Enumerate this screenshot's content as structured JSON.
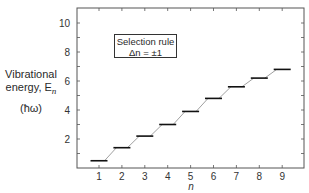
{
  "chart_data": {
    "type": "line",
    "title": "",
    "xlabel": "n",
    "ylabel": "Vibrational energy, E_n (ħω)",
    "ylabel_lines": [
      "Vibrational",
      "energy, E",
      "(ħω)"
    ],
    "ylabel_subscript": "n",
    "x": [
      1,
      2,
      3,
      4,
      5,
      6,
      7,
      8,
      9
    ],
    "values": [
      0.5,
      1.4,
      2.2,
      3.0,
      3.9,
      4.8,
      5.6,
      6.2,
      6.8
    ],
    "series": [
      {
        "name": "Energy levels",
        "values": [
          0.5,
          1.4,
          2.2,
          3.0,
          3.9,
          4.8,
          5.6,
          6.2,
          6.8
        ]
      }
    ],
    "x_ticks": [
      "1",
      "2",
      "3",
      "4",
      "5",
      "6",
      "7",
      "8",
      "9"
    ],
    "y_ticks": [
      "2",
      "4",
      "6",
      "8",
      "10"
    ],
    "xlim": [
      0,
      10
    ],
    "ylim": [
      0,
      11
    ],
    "grid": false,
    "legend": null,
    "annotation": {
      "line1": "Selection rule",
      "line2": "Δn = ±1"
    },
    "style": "horizontal energy-level bars connected by thin diagonal lines"
  },
  "colors": {
    "axis": "#555555",
    "levels": "#111111",
    "connector": "#777777"
  }
}
